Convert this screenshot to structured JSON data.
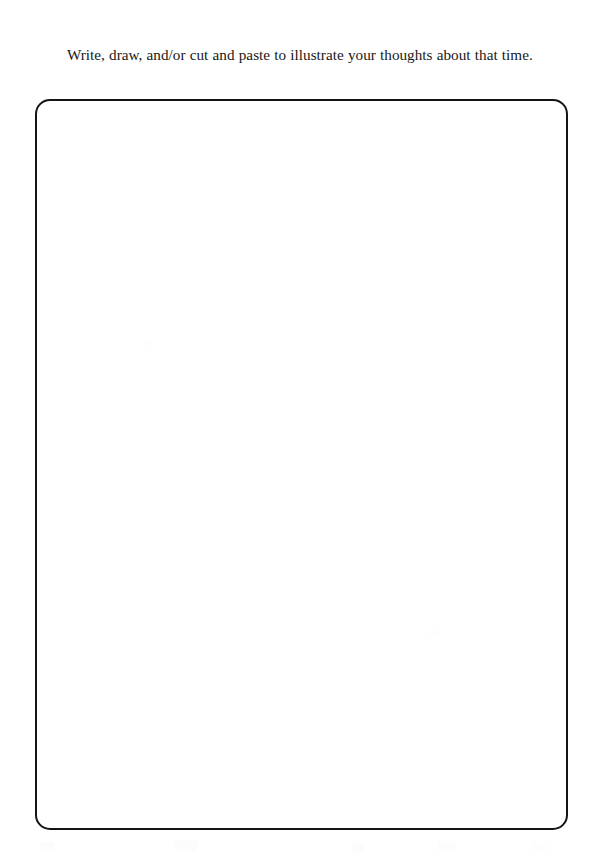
{
  "page": {
    "background_color": "#ffffff",
    "width": 598,
    "height": 863,
    "type": "scanned-workbook-page"
  },
  "instruction": {
    "text": "Write, draw, and/or cut and paste to illustrate your thoughts about that time.",
    "text_color": "#171717",
    "indent_first_line": true
  },
  "response_area": {
    "label": "blank response area",
    "placeholder": "",
    "value": "",
    "border_color": "#141414",
    "fill_color": "#ffffff",
    "corner_radius": "15px",
    "border_width": "2px"
  }
}
